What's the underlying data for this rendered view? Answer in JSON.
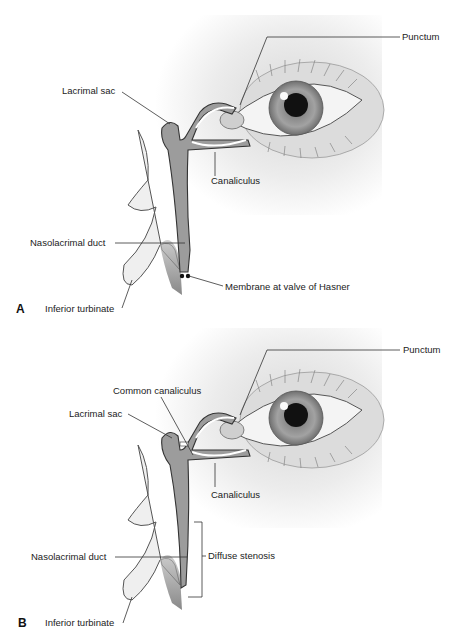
{
  "figure": {
    "panels": [
      {
        "id": "A",
        "letter": "A",
        "labels": {
          "punctum": "Punctum",
          "lacrimal_sac": "Lacrimal sac",
          "canaliculus": "Canaliculus",
          "nasolacrimal_duct": "Nasolacrimal duct",
          "membrane": "Membrane at valve of Hasner",
          "inferior_turbinate": "Inferior turbinate"
        }
      },
      {
        "id": "B",
        "letter": "B",
        "labels": {
          "punctum": "Punctum",
          "common_canaliculus": "Common canaliculus",
          "lacrimal_sac": "Lacrimal sac",
          "canaliculus": "Canaliculus",
          "nasolacrimal_duct": "Nasolacrimal duct",
          "diffuse_stenosis": "Diffuse stenosis",
          "inferior_turbinate": "Inferior turbinate"
        }
      }
    ],
    "colors": {
      "line": "#333333",
      "tissue": "#e8e8e8",
      "duct_fill": "#9a9a9a",
      "iris": "#8c8c8c",
      "pupil": "#111111"
    }
  }
}
